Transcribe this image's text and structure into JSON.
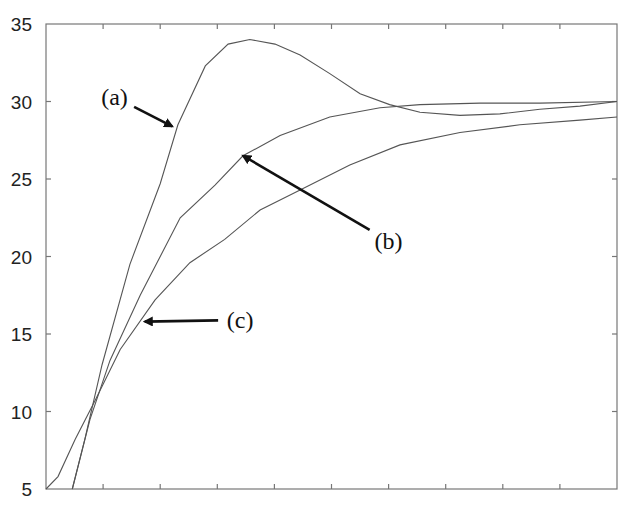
{
  "chart_data": {
    "type": "line",
    "title": "",
    "xlabel": "",
    "ylabel": "",
    "xlim": [
      0,
      10
    ],
    "ylim": [
      5,
      35
    ],
    "grid": false,
    "legend": null,
    "x_ticks": [
      0,
      1,
      2,
      3,
      4,
      5,
      6,
      7,
      8,
      9,
      10
    ],
    "x_tick_labels": [],
    "y_ticks": [
      5,
      10,
      15,
      20,
      25,
      30,
      35
    ],
    "y_tick_labels": [
      "5",
      "10",
      "15",
      "20",
      "25",
      "30",
      "35"
    ],
    "series": [
      {
        "name": "(a)",
        "x": [
          0.46,
          0.68,
          0.98,
          1.47,
          2.0,
          2.31,
          2.79,
          3.19,
          3.57,
          4.01,
          4.45,
          4.97,
          5.5,
          6.02,
          6.55,
          7.25,
          7.95,
          8.65,
          9.35,
          10.0
        ],
        "values": [
          5.0,
          8.2,
          13.0,
          19.5,
          24.7,
          28.5,
          32.3,
          33.7,
          34.0,
          33.7,
          33.0,
          31.8,
          30.5,
          29.8,
          29.3,
          29.1,
          29.2,
          29.5,
          29.7,
          30.0
        ]
      },
      {
        "name": "(b)",
        "x": [
          0.46,
          0.77,
          1.12,
          1.65,
          2.35,
          2.96,
          3.45,
          4.1,
          4.97,
          5.85,
          6.55,
          7.6,
          8.65,
          10.0
        ],
        "values": [
          5.0,
          9.5,
          13.3,
          17.5,
          22.5,
          24.6,
          26.5,
          27.8,
          29.0,
          29.6,
          29.8,
          29.9,
          29.9,
          30.0
        ]
      },
      {
        "name": "(c)",
        "x": [
          0.0,
          0.21,
          0.51,
          0.86,
          1.3,
          1.91,
          2.52,
          3.13,
          3.75,
          4.45,
          5.32,
          6.2,
          7.25,
          8.3,
          9.35,
          10.0
        ],
        "values": [
          5.0,
          5.8,
          8.2,
          10.7,
          14.0,
          17.2,
          19.6,
          21.1,
          23.0,
          24.3,
          25.9,
          27.2,
          28.0,
          28.5,
          28.8,
          29.0
        ]
      }
    ],
    "annotations": [
      {
        "text": "(a)",
        "label_x": 1.2,
        "label_y": 30.3,
        "arrow_to_x": 2.21,
        "arrow_to_y": 28.4
      },
      {
        "text": "(b)",
        "label_x": 6.0,
        "label_y": 21.0,
        "arrow_to_x": 3.45,
        "arrow_to_y": 26.5
      },
      {
        "text": "(c)",
        "label_x": 3.4,
        "label_y": 15.9,
        "arrow_to_x": 1.73,
        "arrow_to_y": 15.8
      }
    ]
  }
}
